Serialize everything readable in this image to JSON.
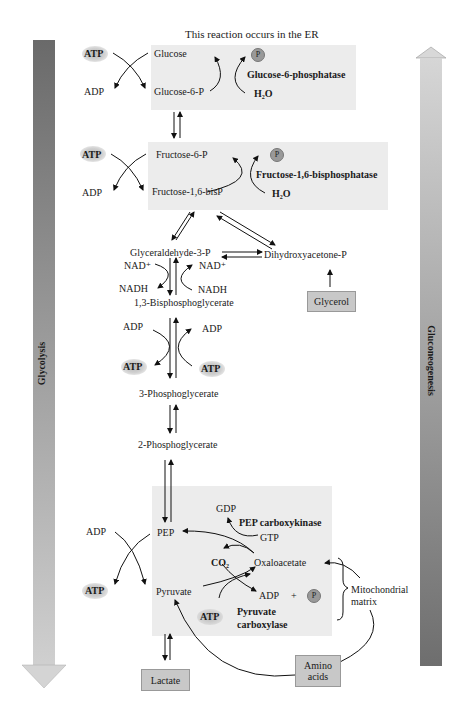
{
  "title_note": "This reaction occurs in the ER",
  "side_arrows": {
    "left": {
      "label": "Glycolysis",
      "direction": "down"
    },
    "right": {
      "label": "Gluconeogenesis",
      "direction": "up"
    }
  },
  "boxes": {
    "hexokinase": {
      "atp": "ATP",
      "adp": "ADP",
      "substrate": "Glucose",
      "product": "Glucose-6-P",
      "enzyme": "Glucose-6-phosphatase",
      "water": "H₂O",
      "phosphate": "P"
    },
    "pfk": {
      "atp": "ATP",
      "adp": "ADP",
      "substrate": "Fructose-6-P",
      "product": "Fructose-1,6-bisP",
      "enzyme": "Fructose-1,6-bisphosphatase",
      "water": "H₂O",
      "phosphate": "P"
    },
    "pyruvate": {
      "adp": "ADP",
      "atp_left": "ATP",
      "pep": "PEP",
      "pyruvate": "Pyruvate",
      "gdp": "GDP",
      "gtp": "GTP",
      "pepck": "PEP carboxykinase",
      "co2": "CO₂",
      "oxaloacetate": "Oxaloacetate",
      "adp2": "ADP",
      "plus": "+",
      "phosphate": "P",
      "atp_bottom": "ATP",
      "pc_line1": "Pyruvate",
      "pc_line2": "carboxylase"
    }
  },
  "metabolites": {
    "gap": "Glyceraldehyde-3-P",
    "dhap": "Dihydroxyacetone-P",
    "nad_left": "NAD⁺",
    "nad_right": "NAD⁺",
    "nadh_left": "NADH",
    "nadh_right": "NADH",
    "bpg": "1,3-Bisphosphoglycerate",
    "adp_left": "ADP",
    "adp_right": "ADP",
    "atp_left": "ATP",
    "atp_right": "ATP",
    "pg3": "3-Phosphoglycerate",
    "pg2": "2-Phosphoglycerate"
  },
  "nodes": {
    "glycerol": "Glycerol",
    "lactate": "Lactate",
    "amino_line1": "Amino",
    "amino_line2": "acids"
  },
  "mito": {
    "line1": "Mitochondrial",
    "line2": "matrix"
  },
  "colors": {
    "box_bg": "#ececec",
    "node_bg": "#c8c8c8",
    "arrow_dark": "#6e6e6e",
    "arrow_light": "#d4d4d4"
  }
}
